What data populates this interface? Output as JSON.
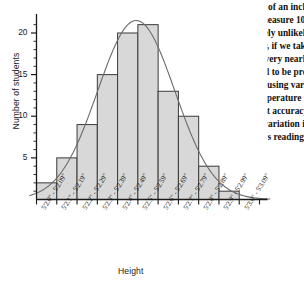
{
  "passage": {
    "lines": [
      "The silly instrument only measures to the nearest tenth of an inch.",
      "Which measurement device will be more precise? If we measure 100",
      "different people with the same instrument, it is extremely unlikely",
      "that we have any two identical measurements. However, if we take",
      "100 measurements of the same person, they will be very nearly",
      "the same. Measurement devices that agree are said to be pre-",
      "cise. The measurement of continuous quantities using vari-",
      "ables such as height, weight, time and temperature is",
      "impossible to do with perfect accuracy.",
      "In each case there is some variation in",
      "an instrument's readings."
    ]
  },
  "chart_data": {
    "type": "bar",
    "title": "",
    "xlabel": "Height",
    "ylabel": "Number of students",
    "categories": [
      "5'2.0\" - 5'2.09\"",
      "5'2.1\" - 5'2.19\"",
      "5'2.2\" - 5'2.29\"",
      "5'2.3\" - 5'2.39\"",
      "5'2.4\" - 5'2.49\"",
      "5'2.5\" - 5'2.59\"",
      "5'2.6\" - 5'2.69\"",
      "5'2.7\" - 5'2.79\"",
      "5'2.8\" - 5'2.89\"",
      "5'2.9\" - 5'2.99\"",
      "5'3.0\" - 5'3.09\""
    ],
    "values": [
      2,
      5,
      9,
      15,
      20,
      21,
      13,
      10,
      4,
      1,
      0
    ],
    "ylim": [
      0,
      21.8
    ],
    "ytick_labels": [
      "5",
      "10",
      "15",
      "20"
    ],
    "ytick_values": [
      5,
      10,
      15,
      20
    ],
    "minor_tick_step": 1,
    "grid": false,
    "legend": "none",
    "bar_fill_color": "#d8d8d8",
    "bar_edge_color": "#3a3a3a",
    "curve_color": "#6b6b6b",
    "curve_label": "normal-distribution-overlay",
    "axis_color": "#1a1a1a"
  }
}
